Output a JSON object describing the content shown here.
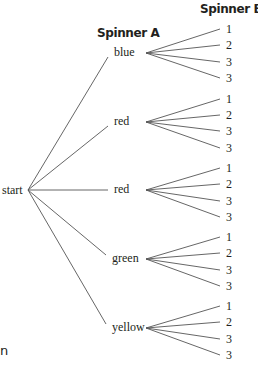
{
  "headers": {
    "spinner_a": "Spinner A",
    "spinner_b": "Spinner B"
  },
  "root": {
    "label": "start",
    "x": 28,
    "y": 190
  },
  "line_color": "#555555",
  "spinner_a": [
    {
      "label": "blue",
      "x": 114,
      "y": 53,
      "join_x": 146,
      "outcomes": [
        "1",
        "2",
        "3",
        "3"
      ],
      "leaf_y": [
        29,
        45,
        62,
        78
      ]
    },
    {
      "label": "red",
      "x": 114,
      "y": 122,
      "join_x": 146,
      "outcomes": [
        "1",
        "2",
        "3",
        "3"
      ],
      "leaf_y": [
        99,
        115,
        131,
        148
      ]
    },
    {
      "label": "red",
      "x": 114,
      "y": 190,
      "join_x": 146,
      "outcomes": [
        "1",
        "2",
        "3",
        "3"
      ],
      "leaf_y": [
        168,
        184,
        201,
        217
      ]
    },
    {
      "label": "green",
      "x": 112,
      "y": 259,
      "join_x": 146,
      "outcomes": [
        "1",
        "2",
        "3",
        "3"
      ],
      "leaf_y": [
        237,
        253,
        270,
        286
      ]
    },
    {
      "label": "yellow",
      "x": 112,
      "y": 328,
      "join_x": 146,
      "outcomes": [
        "1",
        "2",
        "3",
        "3"
      ],
      "leaf_y": [
        306,
        322,
        339,
        355
      ]
    }
  ],
  "cut_text": "n"
}
